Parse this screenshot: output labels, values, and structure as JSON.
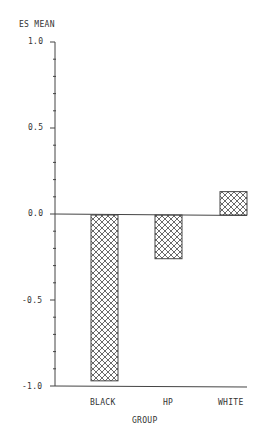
{
  "chart_data": {
    "type": "bar",
    "title": "",
    "xlabel": "GROUP",
    "ylabel": "ES MEAN",
    "categories": [
      "BLACK",
      "HP",
      "WHITE"
    ],
    "values": [
      -0.97,
      -0.26,
      0.13
    ],
    "ylim": [
      -1.0,
      1.0
    ],
    "yticks": [
      "1.0",
      "0.5",
      "0.0",
      "-0.5",
      "-1.0"
    ],
    "minor_ticks_per_major": 5,
    "grid": false,
    "legend": null,
    "fill_pattern": "crosshatch"
  },
  "caption_fragment": "FIGURE 5"
}
